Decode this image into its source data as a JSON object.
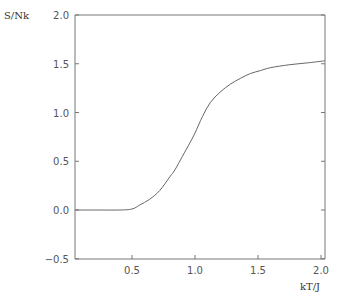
{
  "chart_data": {
    "type": "line",
    "title": "",
    "xlabel": "kT/J",
    "ylabel": "S/Nk",
    "xlim": [
      0.05,
      2.03
    ],
    "ylim": [
      -0.5,
      2.0
    ],
    "grid": false,
    "legend": null,
    "x_ticks": [
      "0.5",
      "1.0",
      "1.5",
      "2.0"
    ],
    "y_ticks": [
      "-0.5",
      "0.0",
      "0.5",
      "1.0",
      "1.5",
      "2.0"
    ],
    "series": [
      {
        "name": "S/Nk",
        "x": [
          0.05,
          0.2,
          0.4,
          0.5,
          0.56,
          0.64,
          0.72,
          0.8,
          0.84,
          0.9,
          0.96,
          1.0,
          1.06,
          1.12,
          1.2,
          1.28,
          1.36,
          1.44,
          1.52,
          1.6,
          1.75,
          1.9,
          2.03
        ],
        "values": [
          0.0,
          0.0,
          0.0,
          0.01,
          0.05,
          0.11,
          0.2,
          0.34,
          0.41,
          0.55,
          0.69,
          0.79,
          0.96,
          1.1,
          1.21,
          1.29,
          1.35,
          1.4,
          1.43,
          1.46,
          1.49,
          1.51,
          1.53
        ]
      }
    ],
    "line_color": "#666666"
  }
}
